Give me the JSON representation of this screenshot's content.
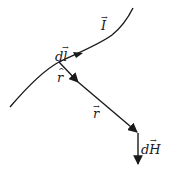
{
  "diagram": {
    "type": "biot-savart-vector-diagram",
    "stroke_color": "#1a1a1a",
    "background": "#ffffff",
    "labels": {
      "current": "I",
      "current_vector_mark": "→",
      "element": "dl",
      "element_vector_mark": "→",
      "unit_r": "r",
      "unit_r_mark": "^",
      "position": "r",
      "position_vector_mark": "→",
      "field": "dH",
      "field_vector_mark": "→"
    }
  }
}
